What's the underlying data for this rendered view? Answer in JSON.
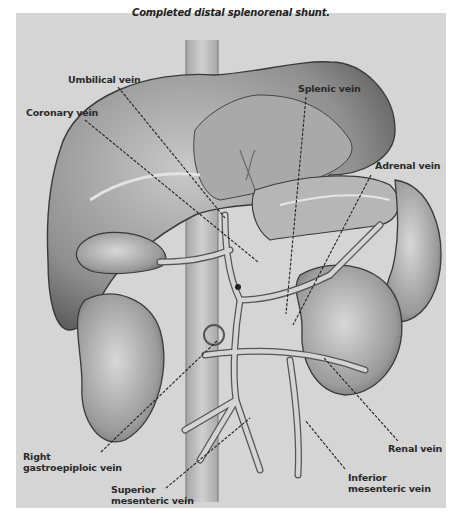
{
  "figure": {
    "title": "Completed distal splenorenal shunt.",
    "background_color": "#d5d5d5",
    "labels": [
      {
        "id": "umbilical",
        "text": "Umbilical vein"
      },
      {
        "id": "coronary",
        "text": "Coronary vein"
      },
      {
        "id": "splenic",
        "text": "Splenic vein"
      },
      {
        "id": "adrenal",
        "text": "Adrenal vein"
      },
      {
        "id": "right_gastroepiploic",
        "line1": "Right",
        "line2": "gastroepiploic vein"
      },
      {
        "id": "renal",
        "text": "Renal vein"
      },
      {
        "id": "superior_mesenteric",
        "line1": "Superior",
        "line2": "mesenteric vein"
      },
      {
        "id": "inferior_mesenteric",
        "line1": "Inferior",
        "line2": "mesenteric vein"
      }
    ]
  }
}
